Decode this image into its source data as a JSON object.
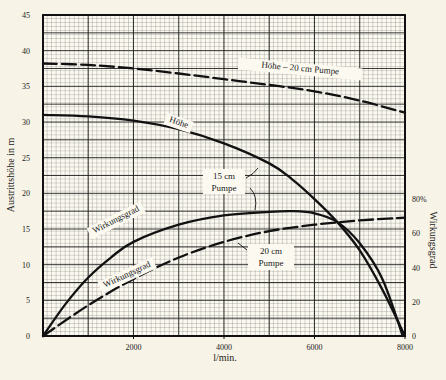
{
  "chart_data": {
    "type": "line",
    "title": "",
    "xlabel": "l/min.",
    "ylabel": "Austrittshöhe in m",
    "y2label": "Wirkungsgrad",
    "xlim": [
      0,
      8000
    ],
    "ylim": [
      0,
      45
    ],
    "y2lim": [
      0,
      80
    ],
    "grid": true,
    "x_ticks": [
      {
        "value": 2000,
        "label": "2000"
      },
      {
        "value": 4000,
        "label": "4000"
      },
      {
        "value": 6000,
        "label": "6000"
      },
      {
        "value": 8000,
        "label": "8000"
      }
    ],
    "y_ticks": [
      {
        "value": 0,
        "label": "0"
      },
      {
        "value": 5,
        "label": "5"
      },
      {
        "value": 10,
        "label": "10"
      },
      {
        "value": 15,
        "label": "15"
      },
      {
        "value": 20,
        "label": "20"
      },
      {
        "value": 25,
        "label": "25"
      },
      {
        "value": 30,
        "label": "30"
      },
      {
        "value": 35,
        "label": "35"
      },
      {
        "value": 40,
        "label": "40"
      },
      {
        "value": 45,
        "label": "45"
      }
    ],
    "y2_ticks": [
      {
        "value": 0,
        "label": "0"
      },
      {
        "value": 20,
        "label": "20"
      },
      {
        "value": 40,
        "label": "40"
      },
      {
        "value": 60,
        "label": "60"
      },
      {
        "value": 80,
        "label": "80%"
      }
    ],
    "series": [
      {
        "name": "Höhe – 20 cm Pumpe",
        "style": "dashed",
        "axis": "left",
        "x": [
          0,
          1000,
          2000,
          3000,
          4000,
          5000,
          6000,
          7000,
          8000
        ],
        "y": [
          38.2,
          38.0,
          37.5,
          36.8,
          36.0,
          35.2,
          34.3,
          33.0,
          31.3
        ]
      },
      {
        "name": "Höhe – 15 cm Pumpe",
        "style": "solid",
        "axis": "left",
        "x": [
          0,
          1000,
          2000,
          3000,
          4000,
          5000,
          5500,
          6000,
          6500,
          7000,
          7500,
          8000
        ],
        "y": [
          31.0,
          30.8,
          30.2,
          29.0,
          27.0,
          24.2,
          22.0,
          19.2,
          16.0,
          12.0,
          6.5,
          0
        ]
      },
      {
        "name": "Wirkungsgrad – 15 cm Pumpe",
        "style": "solid",
        "axis": "left_equivalent",
        "x": [
          0,
          500,
          1000,
          1500,
          2000,
          3000,
          4000,
          5000,
          5500,
          6000,
          6500,
          7000,
          7500,
          7950
        ],
        "y": [
          0,
          4.5,
          8.2,
          11.0,
          13.2,
          15.6,
          16.9,
          17.4,
          17.5,
          17.2,
          16.0,
          13.0,
          8.0,
          0
        ]
      },
      {
        "name": "Wirkungsgrad – 20 cm Pumpe",
        "style": "dashed",
        "axis": "left_equivalent",
        "x": [
          0,
          1000,
          2000,
          3000,
          4000,
          5000,
          6000,
          7000,
          8000
        ],
        "y": [
          0,
          4.3,
          8.0,
          11.0,
          13.2,
          14.7,
          15.6,
          16.2,
          16.6
        ]
      }
    ],
    "annotations": [
      {
        "text": "Höhe – 20 cm Pumpe",
        "id": "hoehe20"
      },
      {
        "text": "Höhe",
        "id": "hoehe15"
      },
      {
        "text": "15 cm",
        "id": "p15a"
      },
      {
        "text": "Pumpe",
        "id": "p15b"
      },
      {
        "text": "Wirkungsgrad",
        "id": "wg15"
      },
      {
        "text": "Wirkungsgrad",
        "id": "wg20"
      },
      {
        "text": "20 cm",
        "id": "p20a"
      },
      {
        "text": "Pumpe",
        "id": "p20b"
      }
    ],
    "colors": {
      "paper": "#f7f3e6",
      "ink": "#111111",
      "grid_major": "#222222",
      "grid_minor": "#555555"
    }
  }
}
